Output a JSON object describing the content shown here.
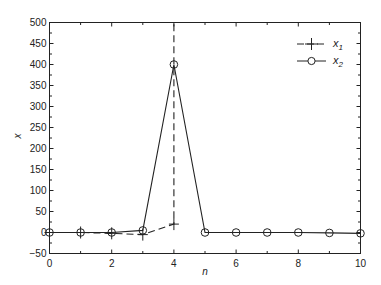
{
  "chart_data": {
    "type": "line",
    "title": "",
    "xlabel": "n",
    "ylabel": "x",
    "xlim": [
      0,
      10
    ],
    "ylim": [
      -50,
      500
    ],
    "x_ticks": [
      0,
      2,
      4,
      6,
      8,
      10
    ],
    "y_ticks": [
      -50,
      0,
      50,
      100,
      150,
      200,
      250,
      300,
      350,
      400,
      450,
      500
    ],
    "grid": false,
    "legend_position": "upper right",
    "x": [
      0,
      1,
      2,
      3,
      4,
      5,
      6,
      7,
      8,
      9,
      10
    ],
    "series": [
      {
        "name": "x_1",
        "style": "dashed",
        "marker": "+",
        "values": [
          0,
          0,
          -2,
          -5,
          20,
          null,
          null,
          null,
          null,
          null,
          null
        ],
        "note": "diverges off-chart after n=4 (vertical dashed line to top)"
      },
      {
        "name": "x_2",
        "style": "solid",
        "marker": "o",
        "values": [
          0,
          0,
          0,
          5,
          400,
          0,
          0,
          0,
          0,
          -1,
          -2
        ]
      }
    ]
  },
  "legend": {
    "x1_label": "x",
    "x1_sub": "1",
    "x2_label": "x",
    "x2_sub": "2"
  },
  "axes": {
    "xlabel": "n",
    "ylabel": "x",
    "y_tick_labels": [
      "500",
      "450",
      "400",
      "350",
      "300",
      "250",
      "200",
      "150",
      "100",
      "50",
      "0",
      "−50"
    ],
    "x_tick_labels": [
      "0",
      "2",
      "4",
      "6",
      "8",
      "10"
    ]
  }
}
